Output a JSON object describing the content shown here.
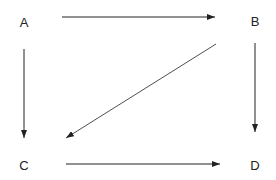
{
  "diagram": {
    "nodes": [
      {
        "id": "A",
        "label": "A",
        "x": 24,
        "y": 22
      },
      {
        "id": "B",
        "label": "B",
        "x": 255,
        "y": 21
      },
      {
        "id": "C",
        "label": "C",
        "x": 24,
        "y": 165
      },
      {
        "id": "D",
        "label": "D",
        "x": 255,
        "y": 165
      }
    ],
    "edges": [
      {
        "from": "A",
        "to": "B"
      },
      {
        "from": "A",
        "to": "C"
      },
      {
        "from": "B",
        "to": "D"
      },
      {
        "from": "B",
        "to": "C"
      },
      {
        "from": "C",
        "to": "D"
      }
    ],
    "colors": {
      "stroke": "#222222",
      "text": "#222222",
      "background": "#ffffff"
    }
  }
}
